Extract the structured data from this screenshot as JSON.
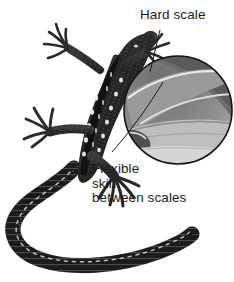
{
  "figure": {
    "background_color": "#ffffff",
    "width": 234,
    "height": 282
  },
  "labels": {
    "hard_scale": {
      "text": "Hard scale",
      "color": "#1b1b1b"
    },
    "flexible_skin": {
      "line1": "Flexible",
      "line2": "skin",
      "line3": "between scales",
      "color": "#1b1b1b"
    }
  },
  "inset": {
    "name": "magnified-scales-inset",
    "shape": "circle",
    "border_color": "#111111",
    "fill_top_color": "#5f5f5f",
    "fill_mid_color": "#8d8d8d",
    "fill_bottom_color": "#d2d2d2",
    "scale_edge_color": "#e8e8e8"
  },
  "illustration": {
    "name": "lizard-illustration",
    "body_color": "#2b2b2b",
    "marking_color": "#f2f2f2",
    "mid_tone_color": "#6a6a6a"
  },
  "leader_lines": {
    "hard_scale_line_color": "#1b1b1b",
    "flexible_skin_line_color": "#1b1b1b"
  }
}
